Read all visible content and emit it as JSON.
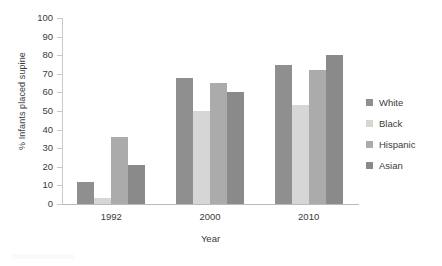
{
  "chart_data": {
    "type": "bar",
    "title": "",
    "subtitle": "",
    "xlabel": "Year",
    "ylabel": "% Infants placed supine",
    "categories": [
      "1992",
      "2000",
      "2010"
    ],
    "series": [
      {
        "name": "White",
        "values": [
          12,
          68,
          75
        ],
        "color": "#8f8f8f"
      },
      {
        "name": "Black",
        "values": [
          3,
          50,
          53
        ],
        "color": "#d6d6d6"
      },
      {
        "name": "Hispanic",
        "values": [
          36,
          65,
          72
        ],
        "color": "#ababab"
      },
      {
        "name": "Asian",
        "values": [
          21,
          60,
          80
        ],
        "color": "#8a8a8a"
      }
    ],
    "ylim": [
      0,
      100
    ],
    "yticks": [
      "0",
      "10",
      "20",
      "30",
      "40",
      "50",
      "60",
      "70",
      "80",
      "90",
      "100"
    ],
    "grid": false,
    "legend_position": "right",
    "axis_color": "#c8c8c8",
    "text_color": "#3b3b3b",
    "background": "#ffffff"
  },
  "legend": {
    "items": [
      {
        "label": "White"
      },
      {
        "label": "Black"
      },
      {
        "label": "Hispanic"
      },
      {
        "label": "Asian"
      }
    ]
  },
  "axes": {
    "y_title": "% Infants placed supine",
    "x_title": "Year"
  }
}
